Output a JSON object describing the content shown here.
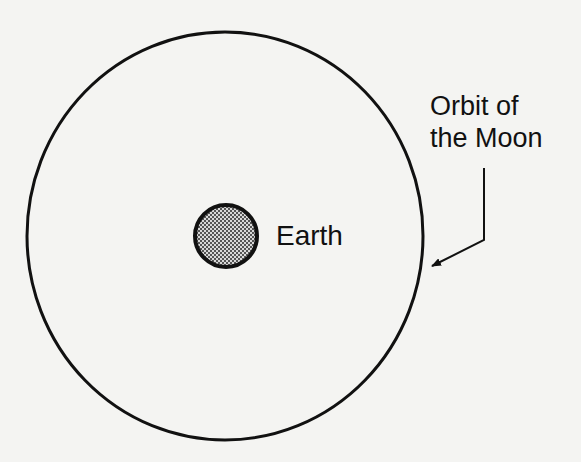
{
  "diagram": {
    "labels": {
      "earth": "Earth",
      "orbit_line1": "Orbit of",
      "orbit_line2": "the Moon"
    },
    "colors": {
      "background": "#f4f4f2",
      "stroke": "#111111",
      "earth_fill_pattern": "checker-gray"
    },
    "shapes": {
      "orbit": {
        "cx": 225,
        "cy": 236,
        "rx": 198,
        "ry": 204
      },
      "earth": {
        "cx": 226,
        "cy": 236,
        "r": 31
      },
      "leader_arrow": {
        "points": [
          [
            484,
            168
          ],
          [
            484,
            240
          ],
          [
            432,
            266
          ]
        ]
      }
    }
  }
}
